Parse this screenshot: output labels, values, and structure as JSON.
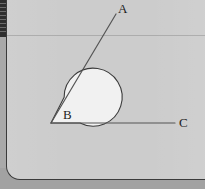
{
  "figure": {
    "type": "geometry-diagram",
    "background_color": "#cccccc",
    "surround_color": "#a9a9a9",
    "sector_fill_color": "#f1f1f1",
    "stroke_color": "#3b3b3b",
    "ray_color": "#555555"
  },
  "labels": {
    "point_a": "A",
    "point_b": "B",
    "point_c": "C"
  },
  "geometry": {
    "vertex": {
      "name": "B",
      "x": 51,
      "y": 123
    },
    "ray_ba": {
      "from_x": 51,
      "from_y": 123,
      "to_x": 116,
      "to_y": 14,
      "endpoint_label": "A"
    },
    "ray_bc": {
      "from_x": 51,
      "from_y": 123,
      "to_x": 175,
      "to_y": 123,
      "endpoint_label": "C"
    },
    "sector": {
      "center_x": 51,
      "center_y": 123,
      "radius": 29,
      "start_angle_deg": 0,
      "end_angle_deg": 300.8,
      "sweep": "reflex",
      "arc_path": "M 80 123 A 29 29 0 1 0 64.13 97.14 L 51 123 Z"
    },
    "circle_bounds": {
      "left": 22,
      "top": 94,
      "right": 80,
      "bottom": 152
    }
  },
  "chrome": {
    "left_strip_color": "#2e2e2e",
    "rule_y": 35
  }
}
